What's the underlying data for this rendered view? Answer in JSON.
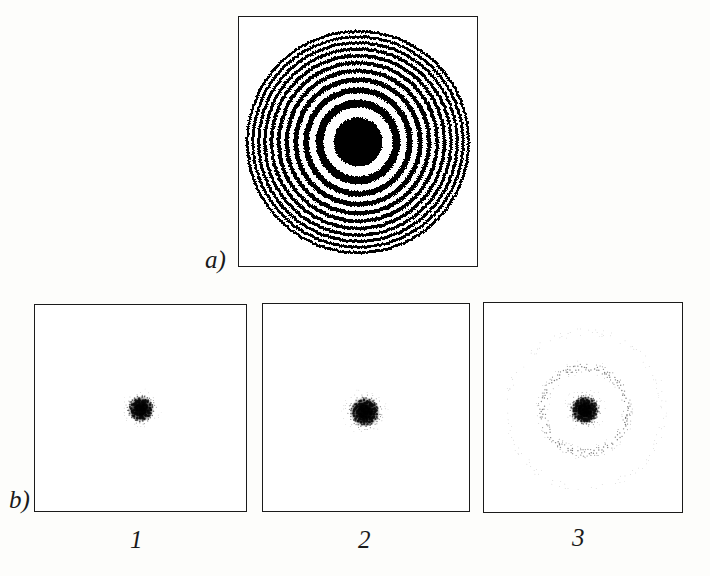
{
  "figure": {
    "background_color": "#fdfdfb",
    "frame_color": "#1b1b1b",
    "ink_color": "#000000",
    "width": 710,
    "height": 576
  },
  "panel_a": {
    "label": "a)",
    "caption_role": "binary-fresnel-zone-plate",
    "frame": {
      "x": 238,
      "y": 16,
      "w": 240,
      "h": 251
    },
    "pattern": {
      "type": "fresnel-zone-plate",
      "center_x": 358,
      "center_y": 142,
      "outer_radius": 112,
      "zone_count": 21,
      "ring_radii_rule": "r_n = R_max * sqrt(n / N)",
      "first_dark_ring_radius": 7,
      "polarity": "opaque-even-zones",
      "fill_color": "#000000",
      "gap_color": "#ffffff",
      "edge_roughness": 1.6
    }
  },
  "panel_b": {
    "label": "b)",
    "caption_role": "focal-spot-intensity-distributions",
    "items": [
      {
        "number": "1",
        "frame": {
          "x": 34,
          "y": 304,
          "w": 213,
          "h": 208
        },
        "spot": {
          "type": "airy-halftone",
          "center_x": 106,
          "center_y": 104,
          "core_radius": 13,
          "halo_radius": 42,
          "ring_count": 2,
          "density": 0.9,
          "dot_pitch": 2.6
        }
      },
      {
        "number": "2",
        "frame": {
          "x": 262,
          "y": 303,
          "w": 208,
          "h": 209
        },
        "spot": {
          "type": "airy-halftone",
          "center_x": 102,
          "center_y": 108,
          "core_radius": 15,
          "halo_radius": 44,
          "ring_count": 2,
          "density": 0.95,
          "dot_pitch": 2.6
        }
      },
      {
        "number": "3",
        "frame": {
          "x": 483,
          "y": 302,
          "w": 200,
          "h": 211
        },
        "spot": {
          "type": "airy-halftone",
          "center_x": 101,
          "center_y": 107,
          "core_radius": 14,
          "halo_radius": 97,
          "ring_count": 5,
          "density": 1.0,
          "dot_pitch": 2.6
        }
      }
    ]
  },
  "labels": {
    "section_a": {
      "text": "a)",
      "x": 205,
      "y": 247
    },
    "section_b": {
      "text": "b)",
      "x": 9,
      "y": 487
    },
    "number_1": {
      "text": "1",
      "x": 130,
      "y": 527
    },
    "number_2": {
      "text": "2",
      "x": 358,
      "y": 527
    },
    "number_3": {
      "text": "3",
      "x": 572,
      "y": 525
    }
  }
}
